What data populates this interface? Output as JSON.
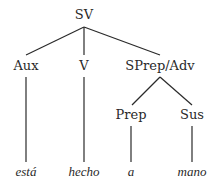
{
  "tree": {
    "root": "SV",
    "level1": [
      "Aux",
      "V",
      "SPrep/Adv"
    ],
    "level2": [
      "Prep",
      "Sus"
    ],
    "leaves": [
      "está",
      "hecho",
      "a",
      "mano"
    ]
  }
}
